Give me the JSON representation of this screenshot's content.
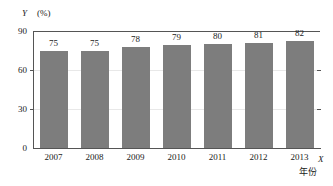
{
  "chart_data": {
    "type": "bar",
    "title": "",
    "categories": [
      "2007",
      "2008",
      "2009",
      "2010",
      "2011",
      "2012",
      "2013"
    ],
    "values": [
      75,
      75,
      78,
      79,
      80,
      81,
      82
    ],
    "series": [
      {
        "name": "",
        "values": [
          75,
          75,
          78,
          79,
          80,
          81,
          82
        ]
      }
    ],
    "xlabel": "X",
    "xlabel_unit": "年份",
    "ylabel": "Y",
    "ylabel_unit": "(%)",
    "ylim": [
      0,
      90
    ],
    "yticks": [
      0,
      30,
      60,
      90
    ],
    "ytick_labels": [
      "0",
      "30",
      "60",
      "90"
    ],
    "grid": true,
    "grid_axis": "y",
    "legend": false,
    "legend_position": "none",
    "bar_color": "#7d7d7d",
    "axis_color": "#555555",
    "gridline_color": "#e8e8e8",
    "text_color": "#1a1a1a",
    "data_labels": [
      "75",
      "75",
      "78",
      "79",
      "80",
      "81",
      "82"
    ]
  }
}
